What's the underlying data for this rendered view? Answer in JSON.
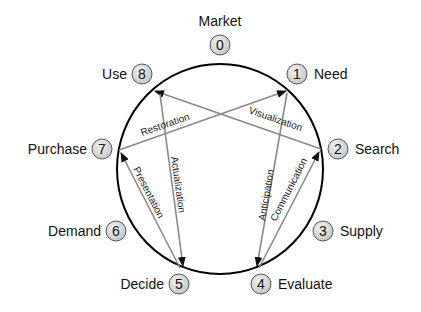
{
  "diagram": {
    "title": "Market",
    "stages": [
      {
        "num": "0",
        "label": "Market"
      },
      {
        "num": "1",
        "label": "Need"
      },
      {
        "num": "2",
        "label": "Search"
      },
      {
        "num": "3",
        "label": "Supply"
      },
      {
        "num": "4",
        "label": "Evaluate"
      },
      {
        "num": "5",
        "label": "Decide"
      },
      {
        "num": "6",
        "label": "Demand"
      },
      {
        "num": "7",
        "label": "Purchase"
      },
      {
        "num": "8",
        "label": "Use"
      }
    ],
    "arrows": [
      {
        "label": "Restoration",
        "from": "7",
        "to": "1"
      },
      {
        "label": "Visualization",
        "from": "2",
        "to": "8"
      },
      {
        "label": "Presentation",
        "from": "5",
        "to": "7"
      },
      {
        "label": "Actualization",
        "from": "8",
        "to": "5"
      },
      {
        "label": "Anticipation",
        "from": "1",
        "to": "4"
      },
      {
        "label": "Communication",
        "from": "4",
        "to": "2"
      }
    ],
    "colors": {
      "circle": "#000000",
      "badge_fill": "#d9d9d9",
      "badge_stroke": "#555555",
      "arrow": "#808080"
    }
  }
}
